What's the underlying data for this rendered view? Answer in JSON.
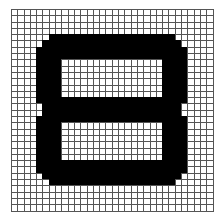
{
  "grid": {
    "cols": 32,
    "rows": 32,
    "fill_color": "#000000",
    "empty_color": "#ffffff",
    "line_color": "#555555",
    "shape": "digit-8",
    "filled_rows": {
      "4": [
        [
          6,
          25
        ]
      ],
      "5": [
        [
          5,
          26
        ]
      ],
      "6": [
        [
          4,
          27
        ]
      ],
      "7": [
        [
          4,
          27
        ]
      ],
      "8": [
        [
          4,
          7
        ],
        [
          24,
          27
        ]
      ],
      "9": [
        [
          4,
          7
        ],
        [
          24,
          27
        ]
      ],
      "10": [
        [
          4,
          7
        ],
        [
          24,
          27
        ]
      ],
      "11": [
        [
          4,
          7
        ],
        [
          24,
          27
        ]
      ],
      "12": [
        [
          4,
          7
        ],
        [
          24,
          27
        ]
      ],
      "13": [
        [
          4,
          7
        ],
        [
          24,
          27
        ]
      ],
      "14": [
        [
          4,
          27
        ]
      ],
      "15": [
        [
          5,
          26
        ]
      ],
      "16": [
        [
          5,
          26
        ]
      ],
      "17": [
        [
          4,
          27
        ]
      ],
      "18": [
        [
          4,
          7
        ],
        [
          24,
          27
        ]
      ],
      "19": [
        [
          4,
          7
        ],
        [
          24,
          27
        ]
      ],
      "20": [
        [
          4,
          7
        ],
        [
          24,
          27
        ]
      ],
      "21": [
        [
          4,
          7
        ],
        [
          24,
          27
        ]
      ],
      "22": [
        [
          4,
          7
        ],
        [
          24,
          27
        ]
      ],
      "23": [
        [
          4,
          7
        ],
        [
          24,
          27
        ]
      ],
      "24": [
        [
          4,
          27
        ]
      ],
      "25": [
        [
          4,
          27
        ]
      ],
      "26": [
        [
          5,
          26
        ]
      ],
      "27": [
        [
          6,
          25
        ]
      ]
    }
  }
}
